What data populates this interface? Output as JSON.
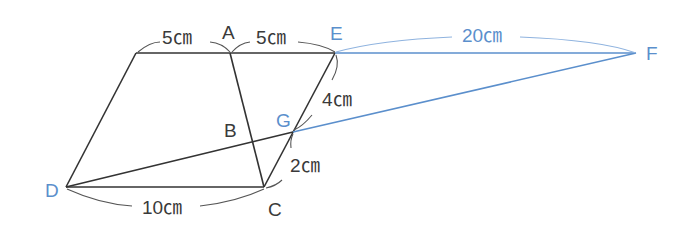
{
  "diagram": {
    "type": "geometry-figure",
    "colors": {
      "line_dark": "#333333",
      "line_blue": "#5b8fcc",
      "text_dark": "#3a3a3a",
      "text_blue": "#5b8fcc"
    },
    "points": {
      "A": {
        "label": "A",
        "x": 230,
        "y": 53
      },
      "B": {
        "label": "B",
        "x": 252,
        "y": 141
      },
      "C": {
        "label": "C",
        "x": 264,
        "y": 187
      },
      "D": {
        "label": "D",
        "x": 66,
        "y": 187
      },
      "E": {
        "label": "E",
        "x": 335,
        "y": 53
      },
      "F": {
        "label": "F",
        "x": 636,
        "y": 53
      },
      "G": {
        "label": "G",
        "x": 293,
        "y": 132
      }
    },
    "measurements": {
      "top_left": "5㎝",
      "top_right": "5㎝",
      "EF": "20㎝",
      "EG": "4㎝",
      "GC": "2㎝",
      "DC": "10㎝"
    }
  }
}
